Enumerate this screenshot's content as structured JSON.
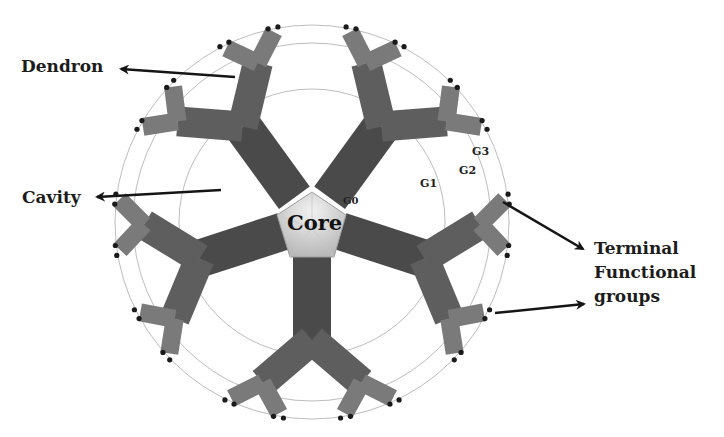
{
  "diagram": {
    "type": "dendrimer-structure",
    "labels": {
      "dendron": "Dendron",
      "cavity": "Cavity",
      "core": "Core",
      "terminal_line1": "Terminal",
      "terminal_line2": "Functional",
      "terminal_line3": "groups"
    },
    "generations": {
      "g0": "G0",
      "g1": "G1",
      "g2": "G2",
      "g3": "G3"
    },
    "colors": {
      "dendron_core_branch": "#4a4a4a",
      "dendron_mid_branch": "#5e5e5e",
      "dendron_outer_branch": "#7a7a7a",
      "core_fill": "#d8d8d8",
      "circle_stroke": "#b9b9b9",
      "terminal_dot": "#1a1a1a",
      "arrow": "#151515",
      "text": "#1c1c1c"
    },
    "dendron_count": 5
  }
}
